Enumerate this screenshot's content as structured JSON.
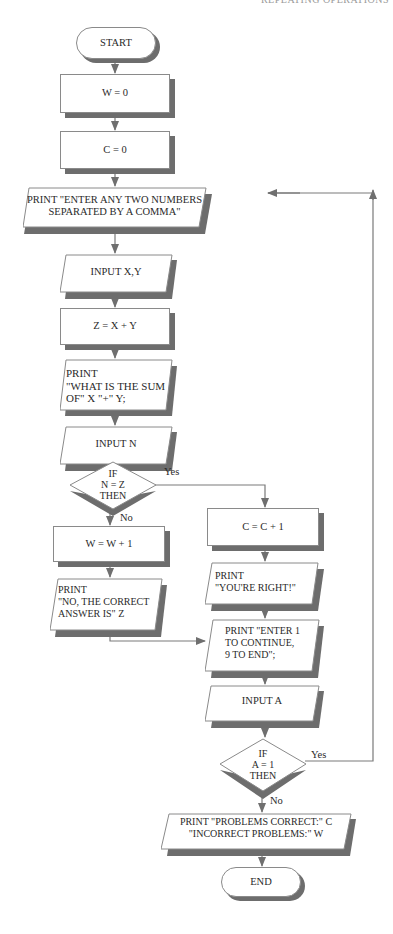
{
  "page_header": "REPEATING OPERATIONS",
  "flowchart": {
    "start": "START",
    "init_w": "W = 0",
    "init_c": "C = 0",
    "print_enter": "PRINT \"ENTER ANY TWO NUMBERS\nSEPARATED BY A COMMA\"",
    "input_xy": "INPUT X,Y",
    "compute_z": "Z = X + Y",
    "print_question": "PRINT\n\"WHAT IS THE SUM\nOF\"  X  \"+\"  Y;",
    "input_n": "INPUT N",
    "decision_nz": "IF\nN = Z\nTHEN",
    "decision_nz_yes": "Yes",
    "decision_nz_no": "No",
    "inc_w": "W = W + 1",
    "inc_c": "C = C + 1",
    "print_wrong": "PRINT\n\"NO, THE CORRECT\nANSWER IS\"  Z",
    "print_right": "PRINT\n\"YOU'RE RIGHT!\"",
    "print_continue": "PRINT \"ENTER 1\nTO CONTINUE,\n9 TO END\";",
    "input_a": "INPUT A",
    "decision_a": "IF\nA = 1\nTHEN",
    "decision_a_yes": "Yes",
    "decision_a_no": "No",
    "print_results": "PRINT \"PROBLEMS CORRECT:\"  C\n\"INCORRECT PROBLEMS:\"  W",
    "end": "END"
  },
  "colors": {
    "line": "#7a7a7a",
    "shadow": "#6d6d6d",
    "border": "#8a8a8a"
  }
}
